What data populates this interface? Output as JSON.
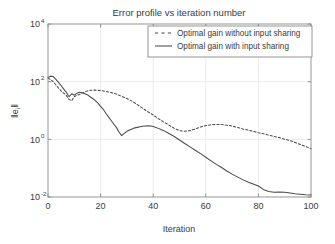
{
  "chart_data": {
    "type": "line",
    "title": "Error profile vs iteration number",
    "xlabel": "Iteration",
    "ylabel": "||e_i||",
    "ylabel_base": "e",
    "ylabel_sub": "i",
    "xlim": [
      0,
      100
    ],
    "ylim": [
      0.01,
      10000
    ],
    "yscale": "log",
    "grid": true,
    "legend_position": "top-right",
    "xticks": [
      0,
      20,
      40,
      60,
      80,
      100
    ],
    "xtick_labels": [
      "0",
      "20",
      "40",
      "60",
      "80",
      "100"
    ],
    "yticks": [
      0.01,
      1,
      100,
      10000
    ],
    "ytick_labels": [
      "10",
      "10",
      "10",
      "10"
    ],
    "ytick_exponents": [
      "-2",
      "0",
      "2",
      "4"
    ],
    "series": [
      {
        "name": "Optimal gain without input sharing",
        "style": "dashed",
        "color": "#4a4a4a",
        "x": [
          0,
          1,
          2,
          3,
          4,
          5,
          6,
          7,
          8,
          9,
          10,
          11,
          12,
          13,
          14,
          15,
          16,
          17,
          18,
          19,
          20,
          22,
          24,
          26,
          28,
          30,
          32,
          34,
          36,
          38,
          40,
          42,
          44,
          46,
          48,
          50,
          52,
          54,
          56,
          58,
          60,
          62,
          64,
          66,
          68,
          70,
          72,
          74,
          76,
          78,
          80,
          82,
          84,
          86,
          88,
          90,
          92,
          94,
          96,
          98,
          100
        ],
        "y": [
          130,
          120,
          100,
          78,
          60,
          48,
          40,
          33,
          24,
          22,
          30,
          34,
          36,
          40,
          44,
          48,
          50,
          51,
          51,
          50,
          49,
          46,
          42,
          37,
          31,
          26,
          21,
          16,
          12,
          9,
          7,
          5.2,
          4,
          3.1,
          2.4,
          2.0,
          1.9,
          2.0,
          2.3,
          2.7,
          3.0,
          3.2,
          3.3,
          3.25,
          3.1,
          2.9,
          2.6,
          2.3,
          2.1,
          1.9,
          1.7,
          1.55,
          1.4,
          1.25,
          1.15,
          1.0,
          0.9,
          0.78,
          0.66,
          0.56,
          0.47
        ]
      },
      {
        "name": "Optimal gain with input sharing",
        "style": "solid",
        "color": "#4a4a4a",
        "x": [
          0,
          1,
          2,
          3,
          4,
          5,
          6,
          7,
          8,
          9,
          10,
          11,
          12,
          13,
          14,
          15,
          16,
          17,
          18,
          19,
          20,
          21,
          22,
          23,
          24,
          25,
          26,
          27,
          28,
          29,
          30,
          31,
          32,
          33,
          34,
          35,
          36,
          37,
          38,
          39,
          40,
          42,
          44,
          46,
          48,
          50,
          52,
          54,
          56,
          58,
          60,
          62,
          64,
          66,
          68,
          70,
          72,
          74,
          76,
          78,
          80,
          82,
          84,
          86,
          88,
          90,
          92,
          94,
          96,
          98,
          100
        ],
        "y": [
          140,
          155,
          150,
          120,
          95,
          72,
          55,
          42,
          30,
          38,
          34,
          40,
          43,
          41,
          38,
          35,
          30,
          26,
          22,
          18,
          14,
          11,
          8,
          6,
          4.5,
          3.4,
          2.6,
          1.8,
          1.35,
          1.6,
          1.9,
          2.1,
          2.3,
          2.5,
          2.6,
          2.75,
          2.85,
          2.9,
          2.95,
          2.9,
          2.8,
          2.4,
          2.0,
          1.6,
          1.25,
          0.95,
          0.72,
          0.55,
          0.42,
          0.32,
          0.24,
          0.18,
          0.135,
          0.105,
          0.08,
          0.062,
          0.05,
          0.04,
          0.033,
          0.028,
          0.024,
          0.018,
          0.0155,
          0.0145,
          0.0148,
          0.0145,
          0.0138,
          0.013,
          0.0125,
          0.012,
          0.0118
        ]
      }
    ]
  },
  "legend": {
    "items": [
      {
        "label": "Optimal gain without input sharing",
        "style": "dashed"
      },
      {
        "label": "Optimal gain with input sharing",
        "style": "solid"
      }
    ]
  }
}
